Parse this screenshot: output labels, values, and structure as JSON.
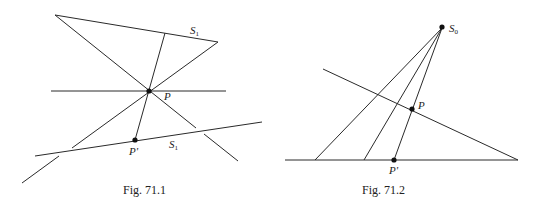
{
  "figures": [
    {
      "id": "fig-71-1",
      "caption": "Fig. 71.1",
      "labels": {
        "S1_top": {
          "main": "S",
          "sub": "1"
        },
        "P": "P",
        "P_prime": "P'",
        "S1_bottom": {
          "main": "S",
          "sub": "1"
        }
      }
    },
    {
      "id": "fig-71-2",
      "caption": "Fig. 71.2",
      "labels": {
        "S0": {
          "main": "S",
          "sub": "0"
        },
        "P": "P",
        "P_prime": "P'"
      }
    }
  ],
  "colors": {
    "line": "#2a2a2a",
    "point": "#111111",
    "background": "#ffffff"
  }
}
